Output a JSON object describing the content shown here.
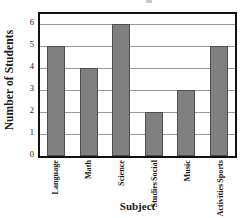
{
  "chart_data": {
    "type": "bar",
    "title": "",
    "xlabel": "Subject",
    "ylabel": "Number of Students",
    "categories": [
      "Language",
      "Math",
      "Science",
      "Social Studies",
      "Music",
      "Sports Activities"
    ],
    "category_lines": [
      [
        "Language"
      ],
      [
        "Math"
      ],
      [
        "Science"
      ],
      [
        "Social",
        "Studies"
      ],
      [
        "Music"
      ],
      [
        "Sports",
        "Activities"
      ]
    ],
    "values": [
      5,
      4,
      6,
      2,
      3,
      5
    ],
    "ylim": [
      0,
      6
    ],
    "yticks": [
      0,
      1,
      2,
      3,
      4,
      5,
      6
    ],
    "ytick_labels": [
      "0",
      "1",
      "2",
      "3",
      "4",
      "5",
      "6"
    ],
    "grid": true,
    "grid_axis": "y",
    "legend": false,
    "bar_color": "#808080",
    "bar_edge_color": "#4d4d4d",
    "grid_color": "#9a9a9a",
    "axis_color": "#111111",
    "background_color": "#ffffff"
  }
}
